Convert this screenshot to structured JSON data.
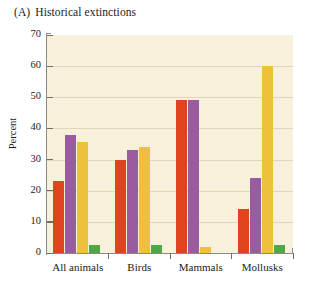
{
  "figure": {
    "panel_letter": "(A)",
    "panel_title": "Historical extinctions"
  },
  "chart_data": {
    "type": "bar",
    "xlabel": "",
    "ylabel": "Percent",
    "ylim": [
      0,
      70
    ],
    "yticks": [
      0,
      10,
      20,
      30,
      40,
      50,
      60,
      70
    ],
    "ytick_labels": [
      "0",
      "10",
      "20",
      "30",
      "40",
      "50",
      "60",
      "70"
    ],
    "grid": false,
    "legend": "none",
    "categories": [
      "All animals",
      "Birds",
      "Mammals",
      "Mollusks"
    ],
    "series": [
      {
        "name": "series-1",
        "color": "#e0441f",
        "values": [
          23,
          30,
          49,
          14
        ]
      },
      {
        "name": "series-2",
        "color": "#9a5ba0",
        "values": [
          38,
          33,
          49,
          24
        ]
      },
      {
        "name": "series-3",
        "color": "#eec13c",
        "values": [
          35.5,
          34,
          2,
          60
        ]
      },
      {
        "name": "series-4",
        "color": "#4ea845",
        "values": [
          2.5,
          2.5,
          0,
          2.5
        ]
      }
    ],
    "colors": {
      "plot_background": "#f7f0da",
      "axis": "#8b8b83",
      "text": "#1b1b1b"
    }
  }
}
